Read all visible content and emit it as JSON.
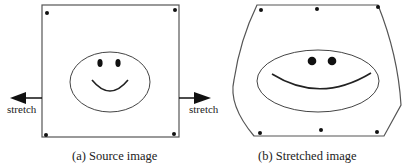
{
  "figure": {
    "panels": [
      {
        "id": "a",
        "caption": "(a) Source image",
        "shape": "square",
        "control_points": 4
      },
      {
        "id": "b",
        "caption": "(b) Stretched image",
        "shape": "warped-barrel",
        "control_points": 6
      }
    ],
    "arrows": [
      {
        "direction": "left",
        "label": "stretch"
      },
      {
        "direction": "right",
        "label": "stretch"
      }
    ]
  },
  "colors": {
    "stroke": "#555555",
    "ink": "#111111",
    "text": "#222222"
  }
}
